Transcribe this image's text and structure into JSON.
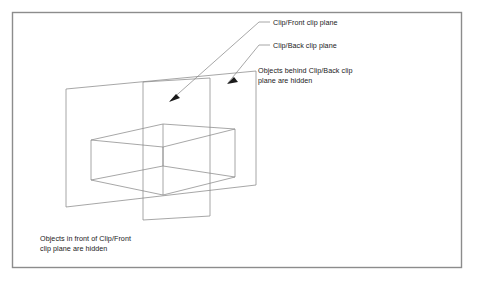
{
  "figure": {
    "background_color": "#ffffff",
    "border_color": "#8c8c8c",
    "line_color": "#8a8a8a",
    "text_color": "#1a1a1a"
  },
  "labels": {
    "front_plane": "Clip/Front clip plane",
    "back_plane": "Clip/Back clip plane",
    "behind_note": "Objects behind Clip/Back clip\nplane are hidden",
    "infront_note": "Objects in front of Clip/Front\nclip plane are hidden"
  },
  "geometry": {
    "frame": {
      "x": 12,
      "y": 12,
      "width": 450,
      "height": 256
    },
    "back_plane": {
      "name": "clip-back-plane",
      "points": "66,89 178,79 256,71 256,185 178,199 66,207"
    },
    "front_plane": {
      "name": "clip-front-plane",
      "points": "143,82 210,78 210,216 143,220"
    },
    "box": {
      "name": "wireframe-box",
      "top_face": "91,140 163,124 235,129 163,147",
      "edges": [
        "91,140 91,180",
        "163,124 163,166",
        "235,129 235,177",
        "163,147 163,195",
        "91,180 163,195",
        "163,195 235,177",
        "91,180 91,140",
        "163,166 163,124",
        "91,140 163,124",
        "163,124 235,129",
        "235,129 163,147",
        "163,147 91,140",
        "163,166 235,177",
        "91,180 163,166",
        "235,177 235,129"
      ]
    },
    "leaders": [
      {
        "name": "leader-front-plane",
        "path": "M 270,22 L 259,22 L 170,101",
        "arrow": "170,101 179,99 175,93"
      },
      {
        "name": "leader-back-plane",
        "path": "M 270,45 L 259,45 L 228,83",
        "arrow": "228,83 237,83 234,77"
      }
    ]
  }
}
